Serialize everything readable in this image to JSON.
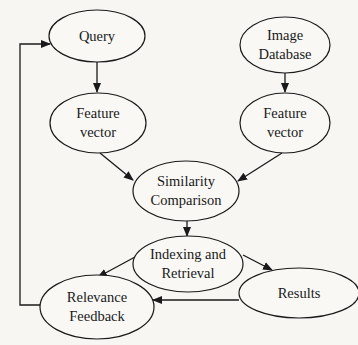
{
  "diagram": {
    "type": "flowchart",
    "nodes": [
      {
        "id": "query",
        "lines": [
          "Query"
        ]
      },
      {
        "id": "image-database",
        "lines": [
          "Image",
          "Database"
        ]
      },
      {
        "id": "feature-vector-query",
        "lines": [
          "Feature",
          "vector"
        ]
      },
      {
        "id": "feature-vector-database",
        "lines": [
          "Feature",
          "vector"
        ]
      },
      {
        "id": "similarity-comparison",
        "lines": [
          "Similarity",
          "Comparison"
        ]
      },
      {
        "id": "indexing-retrieval",
        "lines": [
          "Indexing and",
          "Retrieval"
        ]
      },
      {
        "id": "results",
        "lines": [
          "Results"
        ]
      },
      {
        "id": "relevance-feedback",
        "lines": [
          "Relevance",
          "Feedback"
        ]
      }
    ],
    "edges": [
      {
        "from": "query",
        "to": "feature-vector-query"
      },
      {
        "from": "image-database",
        "to": "feature-vector-database"
      },
      {
        "from": "feature-vector-query",
        "to": "similarity-comparison"
      },
      {
        "from": "feature-vector-database",
        "to": "similarity-comparison"
      },
      {
        "from": "similarity-comparison",
        "to": "indexing-retrieval"
      },
      {
        "from": "indexing-retrieval",
        "to": "relevance-feedback"
      },
      {
        "from": "indexing-retrieval",
        "to": "results"
      },
      {
        "from": "results",
        "to": "relevance-feedback"
      },
      {
        "from": "relevance-feedback",
        "to": "query"
      }
    ]
  }
}
